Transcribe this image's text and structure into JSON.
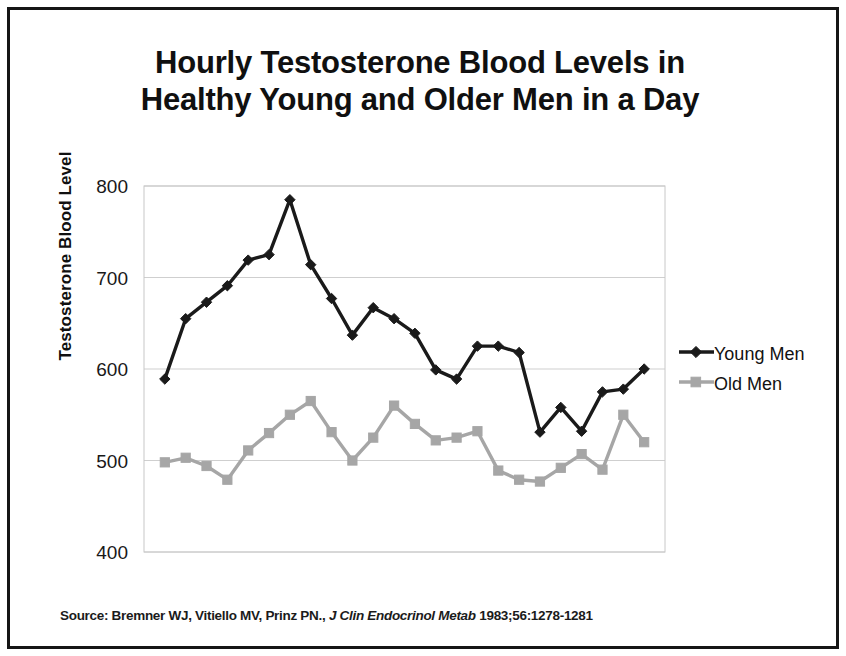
{
  "chart_data": {
    "type": "line",
    "title": "Hourly Testosterone Blood Levels in Healthy Young and Older Men in a Day",
    "title_line1": "Hourly Testosterone Blood Levels in",
    "title_line2": "Healthy Young and Older Men in a Day",
    "xlabel": "",
    "ylabel": "Testosterone Blood Level",
    "ylim": [
      400,
      800
    ],
    "yticks": [
      400,
      500,
      600,
      700,
      800
    ],
    "ytick_labels": [
      "400",
      "500",
      "600",
      "700",
      "800"
    ],
    "grid": true,
    "grid_axis": "y",
    "xticks_visible": false,
    "legend_position": "right",
    "x": [
      1,
      2,
      3,
      4,
      5,
      6,
      7,
      8,
      9,
      10,
      11,
      12,
      13,
      14,
      15,
      16,
      17,
      18,
      19,
      20,
      21,
      22,
      23,
      24
    ],
    "series": [
      {
        "name": "Young Men",
        "color": "#1a1a1a",
        "marker": "diamond",
        "values": [
          589,
          655,
          673,
          691,
          719,
          725,
          785,
          714,
          677,
          637,
          667,
          655,
          639,
          599,
          589,
          625,
          625,
          618,
          531,
          558,
          532,
          575,
          578,
          600
        ]
      },
      {
        "name": "Old Men",
        "color": "#a6a6a6",
        "marker": "square",
        "values": [
          498,
          503,
          494,
          479,
          511,
          530,
          550,
          565,
          531,
          500,
          525,
          560,
          540,
          522,
          525,
          532,
          489,
          479,
          477,
          492,
          507,
          490,
          550,
          520
        ]
      }
    ],
    "legend": [
      {
        "label": "Young Men",
        "marker": "diamond",
        "color": "#1a1a1a"
      },
      {
        "label": "Old Men",
        "marker": "square",
        "color": "#a6a6a6"
      }
    ]
  },
  "source": {
    "prefix": "Source: Bremner WJ, Vitiello MV, Prinz PN.,",
    "journal": "J Clin Endocrinol Metab",
    "citation": "1983;56:1278-1281"
  }
}
